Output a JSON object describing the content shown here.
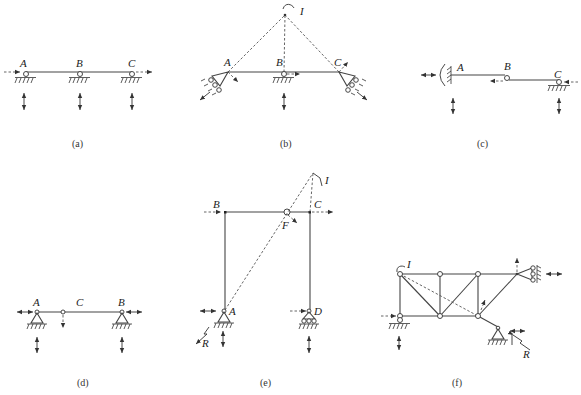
{
  "figure": {
    "panels": [
      {
        "id": "a",
        "caption": "(a)",
        "labels": [
          "A",
          "B",
          "C"
        ],
        "description": "Continuous beam on three roller supports; horizontal dashed arrows at ends, vertical double arrows below each support"
      },
      {
        "id": "b",
        "caption": "(b)",
        "labels": [
          "A",
          "B",
          "C",
          "I"
        ],
        "description": "Beam on inclined roller supports at A and C and roller at B; dashed lines from A, B, C meet at instantaneous center I"
      },
      {
        "id": "c",
        "caption": "(c)",
        "labels": [
          "A",
          "B",
          "C"
        ],
        "description": "Fixed support at A with rotation arc, hinge at B, roller at C"
      },
      {
        "id": "d",
        "caption": "(d)",
        "labels": [
          "A",
          "C",
          "B"
        ],
        "description": "Beam with pin supports at A and B and hinge at C"
      },
      {
        "id": "e",
        "caption": "(e)",
        "labels": [
          "B",
          "C",
          "F",
          "I",
          "A",
          "D",
          "R"
        ],
        "description": "Portal frame with hinge F in girder, pin support A, roller support D; instantaneous center I"
      },
      {
        "id": "f",
        "caption": "(f)",
        "labels": [
          "I",
          "R"
        ],
        "description": "Truss with roller supports and pin support; instantaneous center I and reaction R"
      }
    ]
  }
}
